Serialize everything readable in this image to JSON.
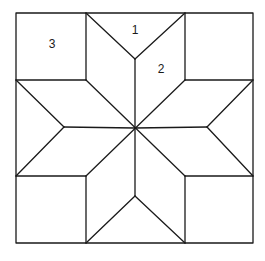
{
  "diagram": {
    "type": "quilt-block-eight-point-star",
    "labels": [
      {
        "id": "piece-1",
        "text": "1",
        "x": 135,
        "y": 34
      },
      {
        "id": "piece-2",
        "text": "2",
        "x": 161,
        "y": 73
      },
      {
        "id": "piece-3",
        "text": "3",
        "x": 52,
        "y": 48
      }
    ],
    "colors": {
      "line": "#1a1a1a",
      "background": "#ffffff"
    }
  }
}
